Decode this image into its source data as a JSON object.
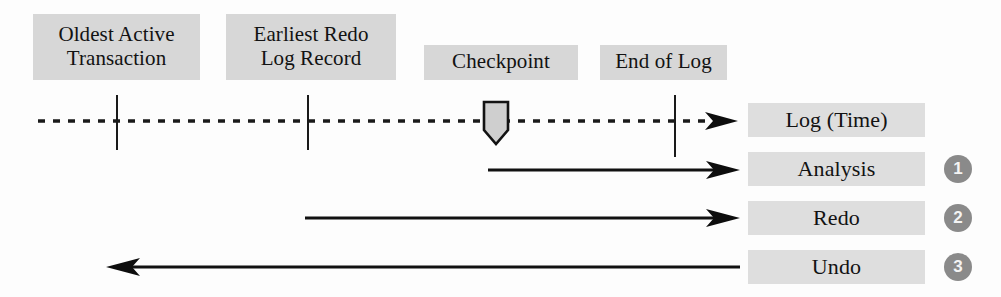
{
  "diagram": {
    "type": "timeline-diagram",
    "colors": {
      "chip_background_top": "#d7d7d7",
      "chip_background_side": "#dedede",
      "line": "#1a1a1a",
      "step_circle": "#8a8a8a",
      "step_number": "#f4f4f4",
      "checkpoint_fill": "#cfcfcf",
      "page_background": "#fdfdfd"
    },
    "markers": [
      {
        "id": "oldest-active-transaction",
        "line1": "Oldest Active",
        "line2": "Transaction",
        "x": 117
      },
      {
        "id": "earliest-redo-log-record",
        "line1": "Earliest Redo",
        "line2": "Log Record",
        "x": 308
      },
      {
        "id": "checkpoint",
        "line1": "Checkpoint",
        "line2": "",
        "x": 496
      },
      {
        "id": "end-of-log",
        "line1": "End of Log",
        "line2": "",
        "x": 675
      }
    ],
    "tracks": [
      {
        "id": "log-time",
        "label": "Log (Time)",
        "style": "dotted",
        "direction": "right",
        "step": null
      },
      {
        "id": "analysis",
        "label": "Analysis",
        "style": "solid",
        "direction": "right",
        "step": "1"
      },
      {
        "id": "redo",
        "label": "Redo",
        "style": "solid",
        "direction": "right",
        "step": "2"
      },
      {
        "id": "undo",
        "label": "Undo",
        "style": "solid",
        "direction": "left",
        "step": "3"
      }
    ],
    "icons": {
      "checkpoint": "checkpoint-pentagon-marker",
      "arrow_right": "arrowhead-right-icon",
      "arrow_left": "arrowhead-left-icon"
    }
  }
}
